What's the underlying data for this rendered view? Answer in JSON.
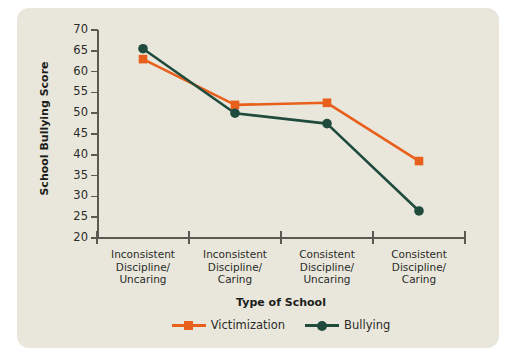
{
  "figure": {
    "cut_off_title": "",
    "panel_color": "#e9e7dc",
    "page_background": "#ffffff"
  },
  "chart_data": {
    "type": "line",
    "title": "",
    "xlabel": "Type of School",
    "ylabel": "School Bullying Score",
    "categories": [
      "Inconsistent\nDiscipline/\nUncaring",
      "Inconsistent\nDiscipline/\nCaring",
      "Consistent\nDiscipline/\nUncaring",
      "Consistent\nDiscipline/\nCaring"
    ],
    "category_lines": [
      [
        "Inconsistent",
        "Discipline/",
        "Uncaring"
      ],
      [
        "Inconsistent",
        "Discipline/",
        "Caring"
      ],
      [
        "Consistent",
        "Discipline/",
        "Uncaring"
      ],
      [
        "Consistent",
        "Discipline/",
        "Caring"
      ]
    ],
    "series": [
      {
        "name": "Victimization",
        "color": "#E8601C",
        "marker": "square",
        "values": [
          63,
          52,
          52.5,
          38.5
        ]
      },
      {
        "name": "Bullying",
        "color": "#1F4A3C",
        "marker": "circle",
        "values": [
          65.5,
          50,
          47.5,
          26.5
        ]
      }
    ],
    "ylim": [
      20,
      70
    ],
    "yticks": [
      70,
      65,
      60,
      55,
      50,
      45,
      40,
      35,
      30,
      25,
      20
    ],
    "ytick_labels": [
      "70",
      "65",
      "60",
      "55",
      "50",
      "45",
      "40",
      "35",
      "30",
      "25",
      "20"
    ],
    "grid": false,
    "legend_position": "bottom-center",
    "axis_color": "#5a5a52"
  },
  "axes": {
    "x_title": "Type of School",
    "y_title": "School Bullying Score"
  },
  "legend": {
    "items": [
      {
        "label": "Victimization",
        "color": "#E8601C",
        "marker": "square"
      },
      {
        "label": "Bullying",
        "color": "#1F4A3C",
        "marker": "circle"
      }
    ]
  }
}
